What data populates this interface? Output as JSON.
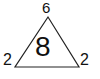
{
  "puzzle": {
    "top_value": "6",
    "left_value": "2",
    "right_value": "2",
    "center_value": "8"
  },
  "colors": {
    "stroke": "#222222",
    "background": "#ffffff"
  }
}
